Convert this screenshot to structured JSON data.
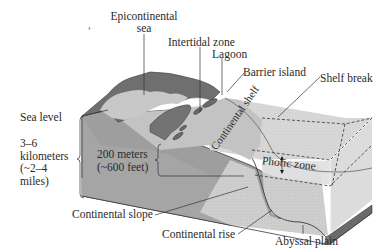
{
  "diagram": {
    "type": "block-diagram",
    "labels": {
      "epicontinental_sea": [
        "Epicontinental",
        "sea"
      ],
      "intertidal_zone": "Intertidal zone",
      "lagoon": "Lagoon",
      "barrier_island": "Barrier island",
      "shelf_break": "Shelf break",
      "sea_level": "Sea level",
      "depth_km": [
        "3–6",
        "kilometers",
        "(~2–4",
        "miles)"
      ],
      "depth_shelf": [
        "200 meters",
        "(~600 feet)"
      ],
      "continental_shelf": "Continental shelf",
      "photic_zone": "Photic zone",
      "continental_slope": "Continental slope",
      "continental_rise": "Continental rise",
      "abyssal_plain": "Abyssal plain",
      "stray_mark": "›"
    },
    "colors": {
      "land_dark": "#6f6f6f",
      "land_mid": "#8a8a8a",
      "shelf_top": "#c9c9c9",
      "water_light": "#dcdcdc",
      "block_side": "#9a9a9a",
      "block_front": "#a6a6a6",
      "deep_face": "#bdbdbd",
      "edge": "#3a3a3a"
    }
  }
}
